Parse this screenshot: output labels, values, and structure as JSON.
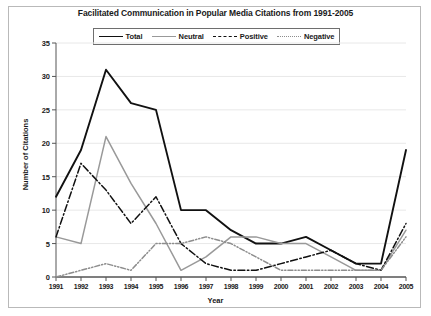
{
  "chart_data": {
    "type": "line",
    "title": "Facilitated Communication in Popular Media Citations from 1991-2005",
    "xlabel": "Year",
    "ylabel": "Number of Citations",
    "categories": [
      "1991",
      "1992",
      "1993",
      "1994",
      "1995",
      "1996",
      "1997",
      "1998",
      "1999",
      "2000",
      "2001",
      "2002",
      "2003",
      "2004",
      "2005"
    ],
    "x": [
      1991,
      1992,
      1993,
      1994,
      1995,
      1996,
      1997,
      1998,
      1999,
      2000,
      2001,
      2002,
      2003,
      2004,
      2005
    ],
    "ylim": [
      0,
      35
    ],
    "yticks": [
      0,
      5,
      10,
      15,
      20,
      25,
      30,
      35
    ],
    "grid": true,
    "legend_position": "top-center",
    "series": [
      {
        "name": "Total",
        "style": "solid",
        "color": "#111111",
        "values": [
          12,
          19,
          31,
          26,
          25,
          10,
          10,
          7,
          5,
          5,
          6,
          4,
          2,
          2,
          19
        ]
      },
      {
        "name": "Neutral",
        "style": "solid",
        "color": "#999999",
        "values": [
          6,
          5,
          21,
          14,
          8,
          1,
          3,
          6,
          6,
          5,
          5,
          3,
          1,
          1,
          7
        ]
      },
      {
        "name": "Positive",
        "style": "dash-dot",
        "color": "#111111",
        "values": [
          6,
          17,
          13,
          8,
          12,
          5,
          2,
          1,
          1,
          2,
          3,
          4,
          2,
          1,
          8
        ]
      },
      {
        "name": "Negative",
        "style": "dash-dot-dot",
        "color": "#8d8d8d",
        "values": [
          0,
          1,
          2,
          1,
          5,
          5,
          6,
          5,
          3,
          1,
          1,
          1,
          1,
          1,
          6
        ]
      }
    ]
  }
}
